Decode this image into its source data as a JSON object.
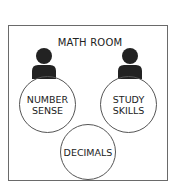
{
  "diagram": {
    "title": "MATH ROOM",
    "people": [
      {
        "icon": "person-icon",
        "position": "left"
      },
      {
        "icon": "person-icon",
        "position": "right"
      }
    ],
    "stations": [
      {
        "line1": "NUMBER",
        "line2": "SENSE"
      },
      {
        "line1": "STUDY",
        "line2": "SKILLS"
      },
      {
        "line1": "DECIMALS",
        "line2": ""
      }
    ]
  }
}
